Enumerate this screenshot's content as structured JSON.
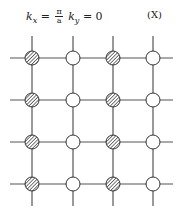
{
  "equation": {
    "kx": "k",
    "kx_sub": "x",
    "eq1": "=",
    "frac_num": "π",
    "frac_den": "a",
    "ky": "k",
    "ky_sub": "y",
    "eq2": "= 0"
  },
  "label": "(X)",
  "lattice": {
    "columns": [
      32,
      73,
      113,
      153
    ],
    "rows": [
      58,
      100,
      142,
      184
    ],
    "radius": 7,
    "pattern": [
      [
        "hatched",
        "open",
        "hatched",
        "open"
      ],
      [
        "hatched",
        "open",
        "hatched",
        "open"
      ],
      [
        "hatched",
        "open",
        "hatched",
        "open"
      ],
      [
        "hatched",
        "open",
        "hatched",
        "open"
      ]
    ],
    "line_color": "#555555",
    "hatch_color": "#666666"
  }
}
